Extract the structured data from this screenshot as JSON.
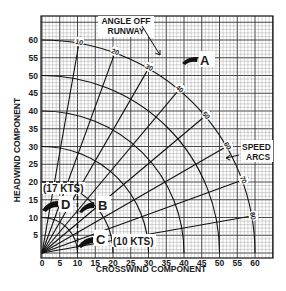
{
  "chart_data": {
    "type": "polar-overlay",
    "title": "",
    "xlabel": "CROSSWIND COMPONENT",
    "ylabel": "HEADWIND COMPONENT",
    "xlim": [
      0,
      65
    ],
    "ylim": [
      0,
      65
    ],
    "x_ticks": [
      0,
      5,
      10,
      15,
      20,
      25,
      30,
      35,
      40,
      45,
      50,
      55,
      60
    ],
    "y_ticks": [
      5,
      10,
      15,
      20,
      25,
      30,
      35,
      40,
      45,
      50,
      55,
      60
    ],
    "grid": true,
    "angle_lines": {
      "label": "ANGLE OFF RUNWAY",
      "degrees": [
        10,
        20,
        30,
        40,
        50,
        60,
        70,
        80
      ]
    },
    "speed_arcs": {
      "label": "SPEED ARCS",
      "knots": [
        10,
        20,
        30,
        40,
        50,
        60
      ]
    },
    "annotations": [
      {
        "id": "A",
        "text": "A",
        "position": [
          33,
          59
        ]
      },
      {
        "id": "B",
        "text": "B",
        "position": [
          17,
          20
        ]
      },
      {
        "id": "C",
        "text": "C",
        "position": [
          15,
          3
        ]
      },
      {
        "id": "D",
        "text": "D",
        "position": [
          5,
          20
        ]
      },
      {
        "text": "(17 KTS)",
        "position": [
          5,
          25
        ]
      },
      {
        "text": "(10 KTS)",
        "position": [
          27,
          3
        ]
      }
    ],
    "dashed_lines": [
      {
        "from": [
          0,
          20
        ],
        "to": [
          10,
          20
        ]
      },
      {
        "from": [
          10,
          20
        ],
        "to": [
          10,
          0
        ]
      }
    ]
  },
  "labels": {
    "angle_title_1": "ANGLE OFF",
    "angle_title_2": "RUNWAY",
    "speed_title_1": "SPEED",
    "speed_title_2": "ARCS",
    "xlabel": "CROSSWIND COMPONENT",
    "ylabel": "HEADWIND COMPONENT",
    "kts17": "(17 KTS)",
    "kts10": "(10 KTS)",
    "A": "A",
    "B": "B",
    "C": "C",
    "D": "D"
  }
}
